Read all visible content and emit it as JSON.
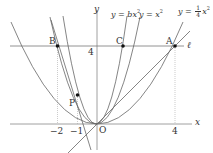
{
  "figure": {
    "origin_label": "O",
    "x_axis_label": "x",
    "y_axis_label": "y",
    "line_label": "ℓ",
    "ticks": {
      "x": [
        "−2",
        "−1",
        "4"
      ],
      "y": [
        "4"
      ]
    },
    "points": [
      {
        "name": "A",
        "x": 4,
        "y": 4
      },
      {
        "name": "B",
        "x": -2,
        "y": 4
      },
      {
        "name": "C",
        "x": 1.33,
        "y": 4
      },
      {
        "name": "P",
        "x": -1,
        "y": 1.5
      }
    ],
    "curves": [
      {
        "label": "y = bx²",
        "lhs": "y",
        "eq": " = ",
        "rhs": "bx",
        "exp": "2"
      },
      {
        "label": "y = x²",
        "lhs": "y",
        "eq": " = ",
        "rhs": "x",
        "exp": "2"
      },
      {
        "label": "y = 1/4 x²",
        "lhs": "y",
        "eq": " = ",
        "num": "1",
        "den": "4",
        "rhs": "x",
        "exp": "2"
      }
    ],
    "colors": {
      "curve": "#555555",
      "axis": "#777777",
      "point": "#111111",
      "dotted": "#999999"
    }
  }
}
